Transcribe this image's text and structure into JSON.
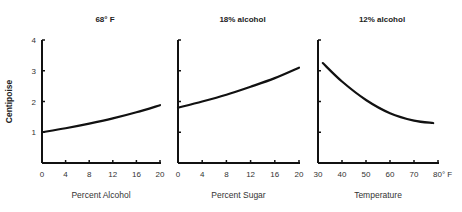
{
  "chart_data": [
    {
      "type": "line",
      "title": "68° F",
      "xlabel": "Percent Alcohol",
      "ylabel": "Centipoise",
      "x_ticks": [
        "0",
        "4",
        "8",
        "12",
        "16",
        "20"
      ],
      "y_ticks": [
        "1",
        "2",
        "3",
        "4"
      ],
      "xlim": [
        0,
        20
      ],
      "ylim": [
        0,
        4
      ],
      "grid": false,
      "series": [
        {
          "name": "viscosity",
          "x": [
            0,
            4,
            8,
            12,
            16,
            20
          ],
          "values": [
            1.0,
            1.13,
            1.28,
            1.45,
            1.65,
            1.88
          ]
        }
      ]
    },
    {
      "type": "line",
      "title": "18% alcohol",
      "xlabel": "Percent Sugar",
      "ylabel": "",
      "x_ticks": [
        "0",
        "4",
        "8",
        "12",
        "16",
        "20"
      ],
      "y_ticks": [],
      "xlim": [
        0,
        20
      ],
      "ylim": [
        0,
        4
      ],
      "grid": false,
      "series": [
        {
          "name": "viscosity",
          "x": [
            0,
            4,
            8,
            12,
            16,
            20
          ],
          "values": [
            1.8,
            2.0,
            2.22,
            2.48,
            2.76,
            3.1
          ]
        }
      ]
    },
    {
      "type": "line",
      "title": "12% alcohol",
      "xlabel": "Temperature",
      "ylabel": "",
      "x_ticks": [
        "30",
        "40",
        "50",
        "60",
        "70",
        "80° F"
      ],
      "y_ticks": [],
      "xlim": [
        30,
        80
      ],
      "ylim": [
        0,
        4
      ],
      "grid": false,
      "series": [
        {
          "name": "viscosity",
          "x": [
            32,
            40,
            50,
            60,
            70,
            78
          ],
          "values": [
            3.25,
            2.65,
            2.05,
            1.62,
            1.38,
            1.3
          ]
        }
      ]
    }
  ]
}
